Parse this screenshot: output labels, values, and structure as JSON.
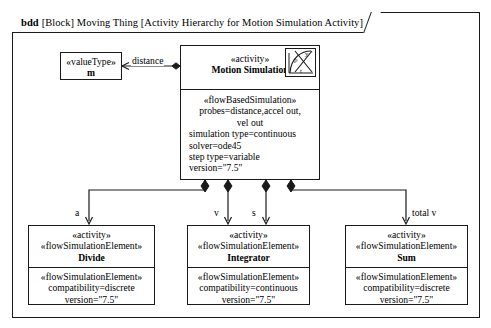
{
  "diagram": {
    "kind": "bdd",
    "header_rest": "[Block] Moving Thing [Activity Hierarchy for Motion Simulation Activity]",
    "icon_axis_y": "y",
    "icon_axis_t": "t",
    "icon_curve_label": "p"
  },
  "parent_block": {
    "stereotype": "«activity»",
    "name": "Motion Simulation",
    "compartment": {
      "stereotype": "«flowBasedSimulation»",
      "lines": [
        "probes=distance,accel out,",
        "vel out",
        "simulation type=continuous",
        "solver=ode45",
        "step type=variable",
        "version=\"7.5\""
      ]
    }
  },
  "value_type_block": {
    "stereotype": "«valueType»",
    "name": "m"
  },
  "associations": [
    {
      "label": "distance",
      "from": "parent_block",
      "to": "value_type_block"
    },
    {
      "label": "a",
      "to": "divide_block"
    },
    {
      "label": "v",
      "to": "integrator_block"
    },
    {
      "label": "s",
      "to": "integrator_block"
    },
    {
      "label": "total v",
      "to": "sum_block"
    }
  ],
  "divide_block": {
    "stereotype": "«activity»",
    "stereotype2": "«flowSimulationElement»",
    "name": "Divide",
    "compartment": {
      "stereotype": "«flowSimulationElement»",
      "lines": [
        "compatibility=discrete",
        "version=\"7.5\""
      ]
    }
  },
  "integrator_block": {
    "stereotype": "«activity»",
    "stereotype2": "«flowSimulationElement»",
    "name": "Integrator",
    "compartment": {
      "stereotype": "«flowSimulationElement»",
      "lines": [
        "compatibility=continuous",
        "version=\"7.5\""
      ]
    }
  },
  "sum_block": {
    "stereotype": "«activity»",
    "stereotype2": "«flowSimulationElement»",
    "name": "Sum",
    "compartment": {
      "stereotype": "«flowSimulationElement»",
      "lines": [
        "compatibility=discrete",
        "version=\"7.5\""
      ]
    }
  },
  "colors": {
    "line": "#1a1a1a",
    "background": "#ffffff"
  }
}
